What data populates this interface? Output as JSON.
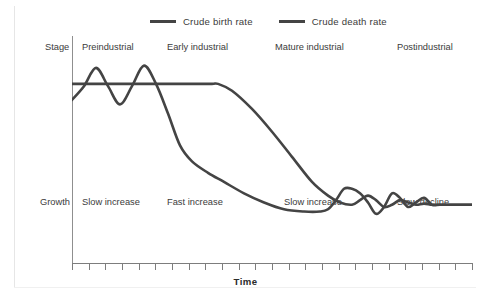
{
  "legend": {
    "items": [
      {
        "label": "Crude birth rate",
        "color": "#444444",
        "icon": "line-swatch-icon"
      },
      {
        "label": "Crude death rate",
        "color": "#444444",
        "icon": "line-swatch-icon"
      }
    ]
  },
  "rows": {
    "stage_label": "Stage",
    "growth_label": "Growth"
  },
  "xaxis": {
    "title": "Time",
    "tick_count": 24
  },
  "chart_data": {
    "type": "line",
    "title": "",
    "subtitle": "",
    "xlabel": "Time",
    "ylabel": "",
    "grid": false,
    "legend_position": "top",
    "xlim": [
      0,
      100
    ],
    "ylim": [
      0,
      100
    ],
    "stages": [
      {
        "name": "Preindustrial",
        "growth": "Slow increase",
        "x_start": 0,
        "x_end": 25
      },
      {
        "name": "Early industrial",
        "growth": "Fast increase",
        "x_start": 25,
        "x_end": 50
      },
      {
        "name": "Mature industrial",
        "growth": "Slow increase",
        "x_start": 50,
        "x_end": 76
      },
      {
        "name": "Postindustrial",
        "growth": "Slow decline",
        "x_start": 76,
        "x_end": 100
      }
    ],
    "series": [
      {
        "name": "Crude birth rate",
        "color": "#444444",
        "x": [
          0,
          5,
          10,
          15,
          20,
          25,
          30,
          35,
          36.5,
          40,
          45,
          50,
          55,
          60,
          64,
          67,
          70,
          72,
          74,
          76,
          78,
          80,
          82,
          84,
          86,
          88,
          90,
          92,
          95,
          100
        ],
        "values": [
          79,
          79,
          79,
          79,
          79,
          79,
          79,
          79,
          79,
          76,
          68,
          58,
          47,
          36,
          30,
          27,
          26,
          28,
          30,
          28,
          25,
          26,
          28,
          27,
          26,
          26.5,
          26,
          26,
          26,
          26
        ]
      },
      {
        "name": "Crude death rate",
        "color": "#444444",
        "x": [
          0,
          3,
          6,
          9,
          12,
          15,
          18,
          21,
          24,
          27,
          30,
          34,
          38,
          43,
          48,
          53,
          58,
          62,
          64,
          66,
          68,
          70,
          72,
          74,
          76,
          78,
          80,
          82,
          84,
          86,
          88,
          90,
          92,
          95,
          100
        ],
        "values": [
          72,
          78,
          86,
          78,
          70,
          78,
          87,
          79,
          66,
          52,
          45,
          40,
          36,
          31,
          27,
          24,
          23,
          23,
          24,
          28,
          33,
          33,
          31,
          27,
          22,
          25,
          31,
          29,
          25,
          27,
          29,
          26,
          26,
          26,
          26
        ]
      }
    ],
    "annotations": [
      "Birth rate remains high and flat through Preindustrial and Early industrial stages, then falls steeply through Mature industrial.",
      "Death rate fluctuates sharply in Preindustrial stage, falls steeply in Early industrial, then levels off.",
      "Both rates converge at a low level in the Postindustrial stage."
    ]
  }
}
